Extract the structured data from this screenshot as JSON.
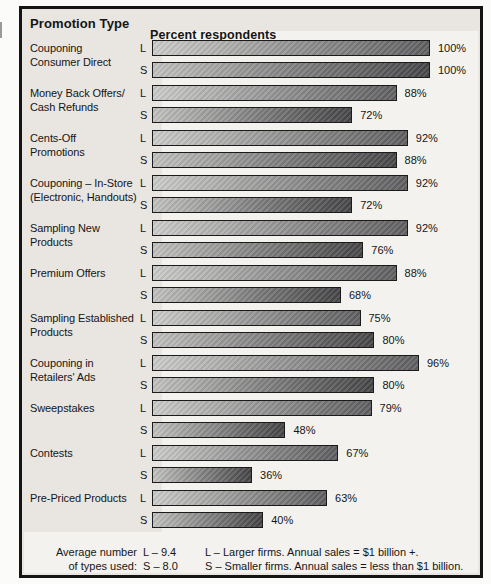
{
  "chart_data": {
    "type": "bar",
    "orientation": "horizontal",
    "ylabel": "Promotion Type",
    "xlabel": "Percent respondents",
    "xlim": [
      0,
      100
    ],
    "value_suffix": "%",
    "grid": false,
    "legend_position": "bottom",
    "categories": [
      "Couponing Consumer Direct",
      "Money Back Offers/ Cash Refunds",
      "Cents-Off Promotions",
      "Couponing – In-Store (Electronic, Handouts)",
      "Sampling New Products",
      "Premium Offers",
      "Sampling Established Products",
      "Couponing in Retailers' Ads",
      "Sweepstakes",
      "Contests",
      "Pre-Priced Products"
    ],
    "category_label_lines": [
      [
        "Couponing",
        "Consumer Direct"
      ],
      [
        "Money Back Offers/",
        "Cash Refunds"
      ],
      [
        "Cents-Off",
        "Promotions"
      ],
      [
        "Couponing – In-Store",
        "(Electronic, Handouts)"
      ],
      [
        "Sampling New",
        "Products"
      ],
      [
        "Premium Offers"
      ],
      [
        "Sampling Established",
        "Products"
      ],
      [
        "Couponing in",
        "Retailers' Ads"
      ],
      [
        "Sweepstakes"
      ],
      [
        "Contests"
      ],
      [
        "Pre-Priced Products"
      ]
    ],
    "series": [
      {
        "name": "L",
        "values": [
          100,
          88,
          92,
          92,
          92,
          88,
          75,
          96,
          79,
          67,
          63
        ]
      },
      {
        "name": "S",
        "values": [
          100,
          72,
          88,
          72,
          76,
          68,
          80,
          80,
          48,
          36,
          40
        ]
      }
    ],
    "colors": {
      "frame": "#141414",
      "panel_bg": "#e9e6e2",
      "band_bg": "#f4f2ee",
      "bar_border": "#1b1b1b",
      "bar_l_start": "#cbcbc9",
      "bar_l_end": "#5f5f61",
      "bar_s_start": "#c1c1bf",
      "bar_s_end": "#454547"
    }
  },
  "footer": {
    "avg_label_lines": [
      "Average number",
      "of types used:"
    ],
    "avg_values": [
      "L – 9.4",
      "S – 8.0"
    ],
    "legend_lines": [
      "L – Larger firms. Annual sales = $1 billion +.",
      "S – Smaller firms. Annual sales = less than $1 billion."
    ]
  }
}
